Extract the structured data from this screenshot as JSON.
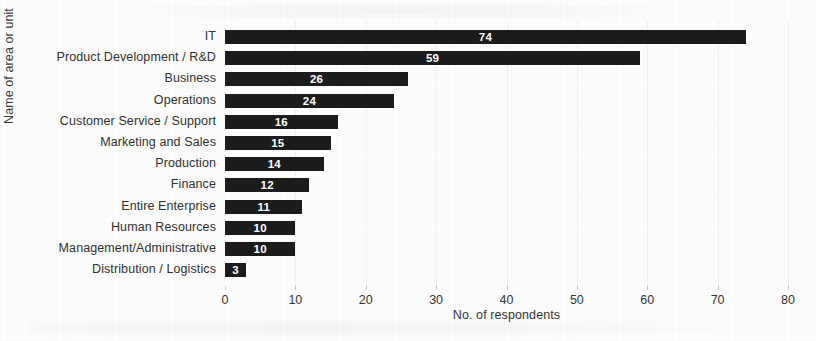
{
  "chart_data": {
    "type": "bar",
    "orientation": "horizontal",
    "title": "",
    "xlabel": "No. of respondents",
    "ylabel": "Name of area or unit",
    "xlim": [
      0,
      80
    ],
    "xticks": [
      0,
      10,
      20,
      30,
      40,
      50,
      60,
      70,
      80
    ],
    "grid": true,
    "grid_axis": "x",
    "legend": false,
    "bar_color": "#1c1c1c",
    "value_label_color": "#ffffff",
    "categories": [
      "IT",
      "Product Development / R&D",
      "Business",
      "Operations",
      "Customer Service / Support",
      "Marketing and Sales",
      "Production",
      "Finance",
      "Entire Enterprise",
      "Human Resources",
      "Management/Administrative",
      "Distribution / Logistics"
    ],
    "values": [
      74,
      59,
      26,
      24,
      16,
      15,
      14,
      12,
      11,
      10,
      10,
      3
    ]
  }
}
